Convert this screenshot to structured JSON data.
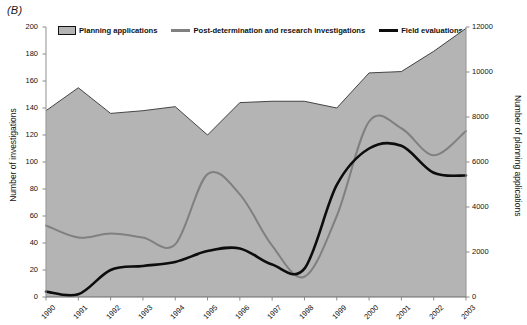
{
  "panel": {
    "label": "(B)"
  },
  "legend": {
    "items": [
      {
        "key": "planning-applications",
        "label": "Planning applications",
        "marker": "area-swatch",
        "color": "#b4b4b4"
      },
      {
        "key": "post-determination",
        "label": "Post-determination and research investigations",
        "marker": "line-swatch",
        "color": "#808080"
      },
      {
        "key": "field-evaluations",
        "label": "Field evaluations",
        "marker": "line-swatch",
        "color": "#0d0d0d"
      }
    ]
  },
  "chart_data": {
    "type": "area",
    "title": "(B)",
    "xlabel": "",
    "ylabel": "Number of investigations",
    "y2label": "Number of planning applications",
    "grid": false,
    "legend_position": "top",
    "categories": [
      "1990",
      "1991",
      "1992",
      "1993",
      "1994",
      "1995",
      "1996",
      "1997",
      "1998",
      "1999",
      "2000",
      "2001",
      "2002",
      "2003"
    ],
    "ylim": [
      0,
      200
    ],
    "yticks": [
      0,
      20,
      40,
      60,
      80,
      100,
      120,
      140,
      160,
      180,
      200
    ],
    "y2lim": [
      0,
      12000
    ],
    "y2ticks": [
      0,
      2000,
      4000,
      6000,
      8000,
      10000,
      12000
    ],
    "series": [
      {
        "name": "Planning applications",
        "type": "area",
        "axis": "right",
        "color": "#b4b4b4",
        "edge_color": "#333333",
        "values": [
          8280,
          9300,
          8160,
          8280,
          8460,
          7200,
          8640,
          8700,
          8700,
          8400,
          9960,
          10020,
          10920,
          11940
        ]
      },
      {
        "name": "Post-determination and research investigations",
        "type": "line",
        "axis": "left",
        "color": "#808080",
        "values": [
          53,
          44,
          47,
          44,
          39,
          91,
          76,
          38,
          15,
          60,
          130,
          125,
          105,
          123
        ]
      },
      {
        "name": "Field evaluations",
        "type": "line",
        "axis": "left",
        "color": "#0d0d0d",
        "values": [
          4,
          2,
          20,
          23,
          26,
          34,
          36,
          24,
          21,
          83,
          110,
          112,
          92,
          90
        ]
      }
    ]
  }
}
